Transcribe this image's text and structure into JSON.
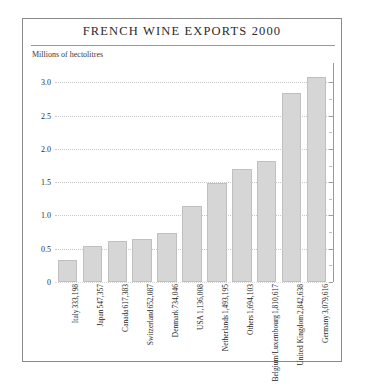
{
  "chart_data": {
    "type": "bar",
    "title": "FRENCH WINE EXPORTS 2000",
    "subtitle": "Millions of hectolitres",
    "xlabel": "",
    "ylabel": "Millions of hectolitres",
    "ylim": [
      0,
      3.2
    ],
    "grid": true,
    "legend": "none",
    "orientation": "vertical",
    "yticks": [
      "3.0",
      "2.5",
      "2.0",
      "1.5",
      "1.0",
      "0.5",
      "0"
    ],
    "ytick_values": [
      3.0,
      2.5,
      2.0,
      1.5,
      1.0,
      0.5,
      0
    ],
    "categories": [
      "Italy",
      "Japan",
      "Canada",
      "Switzerland",
      "Denmark",
      "USA",
      "Netherlands",
      "Others",
      "Belgium/Luxembourg",
      "United Kingdom",
      "Germany"
    ],
    "value_labels": [
      "333,198",
      "547,357",
      "617,383",
      "652,087",
      "734,046",
      "1,136,008",
      "1,493,195",
      "1,694,103",
      "1,810,617",
      "2,842,638",
      "3,079,616"
    ],
    "values": [
      0.333198,
      0.547357,
      0.617383,
      0.652087,
      0.734046,
      1.136008,
      1.493195,
      1.694103,
      1.810617,
      2.842638,
      3.079616
    ],
    "bar_color": "#d6d6d6",
    "bar_border_color": "#c0c0c0",
    "gridline_color": "#c9c9c9",
    "frame_color": "#8a8a8a",
    "text_color": "#262626"
  }
}
